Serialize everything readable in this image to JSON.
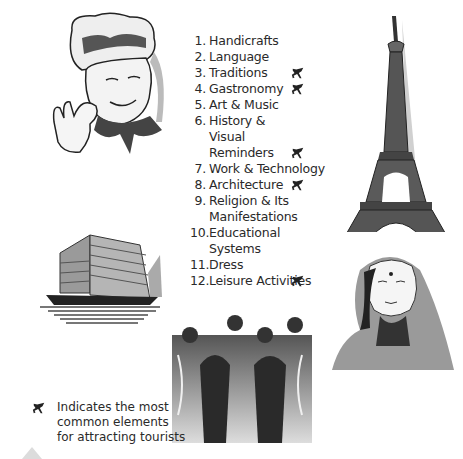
{
  "list": {
    "items": [
      {
        "num": "1.",
        "lines": [
          "Handicrafts"
        ],
        "highlight": false
      },
      {
        "num": "2.",
        "lines": [
          "Language"
        ],
        "highlight": false
      },
      {
        "num": "3.",
        "lines": [
          "Traditions"
        ],
        "highlight": true
      },
      {
        "num": "4.",
        "lines": [
          "Gastronomy"
        ],
        "highlight": true
      },
      {
        "num": "5.",
        "lines": [
          "Art & Music"
        ],
        "highlight": false
      },
      {
        "num": "6.",
        "lines": [
          "History &",
          "Visual",
          "Reminders"
        ],
        "highlight": true
      },
      {
        "num": "7.",
        "lines": [
          "Work & Technology"
        ],
        "highlight": false
      },
      {
        "num": "8.",
        "lines": [
          "Architecture"
        ],
        "highlight": true
      },
      {
        "num": "9.",
        "lines": [
          "Religion & Its",
          "Manifestations"
        ],
        "highlight": false
      },
      {
        "num": "10.",
        "lines": [
          "Educational",
          "Systems"
        ],
        "highlight": false
      },
      {
        "num": "11.",
        "lines": [
          "Dress"
        ],
        "highlight": false
      },
      {
        "num": "12.",
        "lines": [
          "Leisure Activities"
        ],
        "highlight": true
      }
    ]
  },
  "legend": {
    "icon": "airplane-icon",
    "lines": [
      "Indicates the most",
      "common elements",
      "for attracting tourists"
    ]
  },
  "illustrations": {
    "chef": "chef-illustration",
    "eiffel_tower": "eiffel-tower-illustration",
    "junk_ship": "junk-ship-illustration",
    "musicians": "jazz-band-illustration",
    "woman": "woman-in-sari-illustration"
  }
}
